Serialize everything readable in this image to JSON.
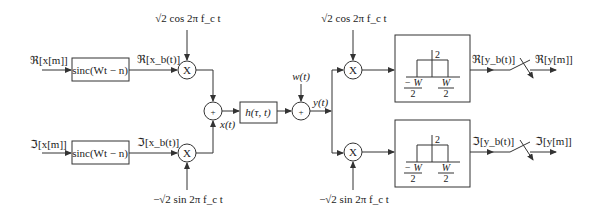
{
  "diagram": {
    "type": "block-diagram",
    "title": "",
    "inputs": {
      "real": "ℜ[x[m]]",
      "imag": "ℑ[x[m]]"
    },
    "interp_filter": {
      "top": "sinc(Wt − n)",
      "bottom": "sinc(Wt − n)"
    },
    "baseband_signals": {
      "real": "ℜ[x_b(t)]",
      "imag": "ℑ[x_b(t)]"
    },
    "carriers": {
      "tx_cos": "√2 cos 2π f_c t",
      "tx_sin": "−√2 sin 2π f_c t",
      "rx_cos": "√2 cos 2π f_c t",
      "rx_sin": "−√2 sin 2π f_c t"
    },
    "multiplier_symbol": "X",
    "adder_symbol": "+",
    "tx_signal": "x(t)",
    "channel": "h(τ, t)",
    "noise": "w(t)",
    "rx_signal": "y(t)",
    "lowpass_filter": {
      "gain": "2",
      "left_edge_num": "− W",
      "right_edge_num": "W",
      "denominator": "2"
    },
    "rx_baseband": {
      "real": "ℜ[y_b(t)]",
      "imag": "ℑ[y_b(t)]"
    },
    "outputs": {
      "real": "ℜ[y[m]]",
      "imag": "ℑ[y[m]]"
    }
  }
}
